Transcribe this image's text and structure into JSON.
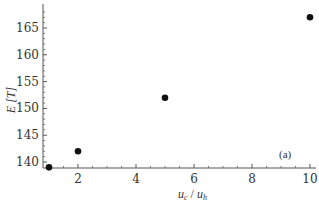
{
  "chart_data": {
    "type": "scatter",
    "title": "",
    "xlabel": "u_c / u_h",
    "ylabel": "E [T]",
    "panel_label": "(a)",
    "x": [
      1,
      2,
      5,
      10
    ],
    "y": [
      139,
      142,
      152,
      167
    ],
    "series": [
      {
        "name": "E[T]",
        "x": [
          1,
          2,
          5,
          10
        ],
        "values": [
          139,
          142,
          152,
          167
        ]
      }
    ],
    "xlim": [
      0.8,
      10.2
    ],
    "ylim": [
      138.8,
      168.5
    ],
    "x_ticks": [
      2,
      4,
      6,
      8,
      10
    ],
    "y_ticks": [
      140,
      145,
      150,
      155,
      160,
      165
    ],
    "grid": false,
    "legend": "none",
    "marker_color": "#111111"
  },
  "labels": {
    "xlabel_main": "u",
    "xlabel_sub1": "c",
    "xlabel_sep": " / ",
    "xlabel_main2": "u",
    "xlabel_sub2": "h",
    "ylabel": "E [T]",
    "panel": "(a)",
    "x_tick_labels": [
      "2",
      "4",
      "6",
      "8",
      "10"
    ],
    "y_tick_labels": [
      "140",
      "145",
      "150",
      "155",
      "160",
      "165"
    ]
  }
}
